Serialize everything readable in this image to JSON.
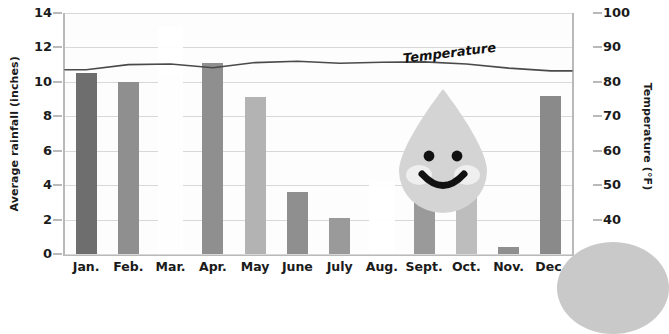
{
  "chart_data": {
    "type": "bar",
    "title": "",
    "xlabel": "",
    "ylabel": "Average rainfall (inches)",
    "y2label": "Temperature (°F)",
    "grid": true,
    "legend": "inline-label",
    "categories": [
      "Jan.",
      "Feb.",
      "Mar.",
      "Apr.",
      "May",
      "June",
      "July",
      "Aug.",
      "Sept.",
      "Oct.",
      "Nov.",
      "Dec."
    ],
    "ylim": [
      0,
      14
    ],
    "y_ticks": [
      0,
      2,
      4,
      6,
      8,
      10,
      12,
      14
    ],
    "y2lim": [
      30,
      100
    ],
    "y2_ticks": [
      30,
      40,
      50,
      60,
      70,
      80,
      90,
      100
    ],
    "series": [
      {
        "name": "Average rainfall (inches)",
        "type": "bar",
        "axis": "left",
        "values": [
          10.5,
          10.0,
          10.4,
          11.1,
          9.1,
          3.6,
          2.1,
          1.6,
          3.0,
          4.8,
          0.4,
          9.2
        ],
        "colors": [
          "#6e6e6e",
          "#8f8f8f",
          "#f2f2f2",
          "#8f8f8f",
          "#b3b3b3",
          "#8f8f8f",
          "#9a9a9a",
          "#fbfbfb",
          "#9a9a9a",
          "#bdbdbd",
          "#8f8f8f",
          "#8a8a8a"
        ]
      },
      {
        "name": "Temperature",
        "type": "line",
        "axis": "right",
        "color": "#4a4a4a",
        "label": "Temperature",
        "values": [
          83.5,
          85.0,
          85.2,
          84.1,
          85.6,
          86.0,
          85.4,
          85.7,
          85.8,
          85.2,
          84.0,
          83.2
        ]
      }
    ]
  },
  "axes": {
    "left": {
      "title": "Average rainfall (inches)",
      "ticks": [
        "14",
        "12",
        "10",
        "8",
        "6",
        "4",
        "2",
        "0"
      ]
    },
    "right": {
      "title": "Temperature (°F)",
      "ticks": [
        "100",
        "90",
        "80",
        "70",
        "60",
        "50",
        "40",
        "30"
      ]
    }
  },
  "annotations": {
    "temperature_label": "Temperature",
    "watermark": "smiling-raindrop"
  },
  "colors": {
    "gridline": "#d8d8d8",
    "axis": "#b9b9b9",
    "text": "#1b1b1b",
    "line": "#4a4a4a",
    "watermark": "#d4d4d4",
    "corner": "#c9c9c9"
  }
}
